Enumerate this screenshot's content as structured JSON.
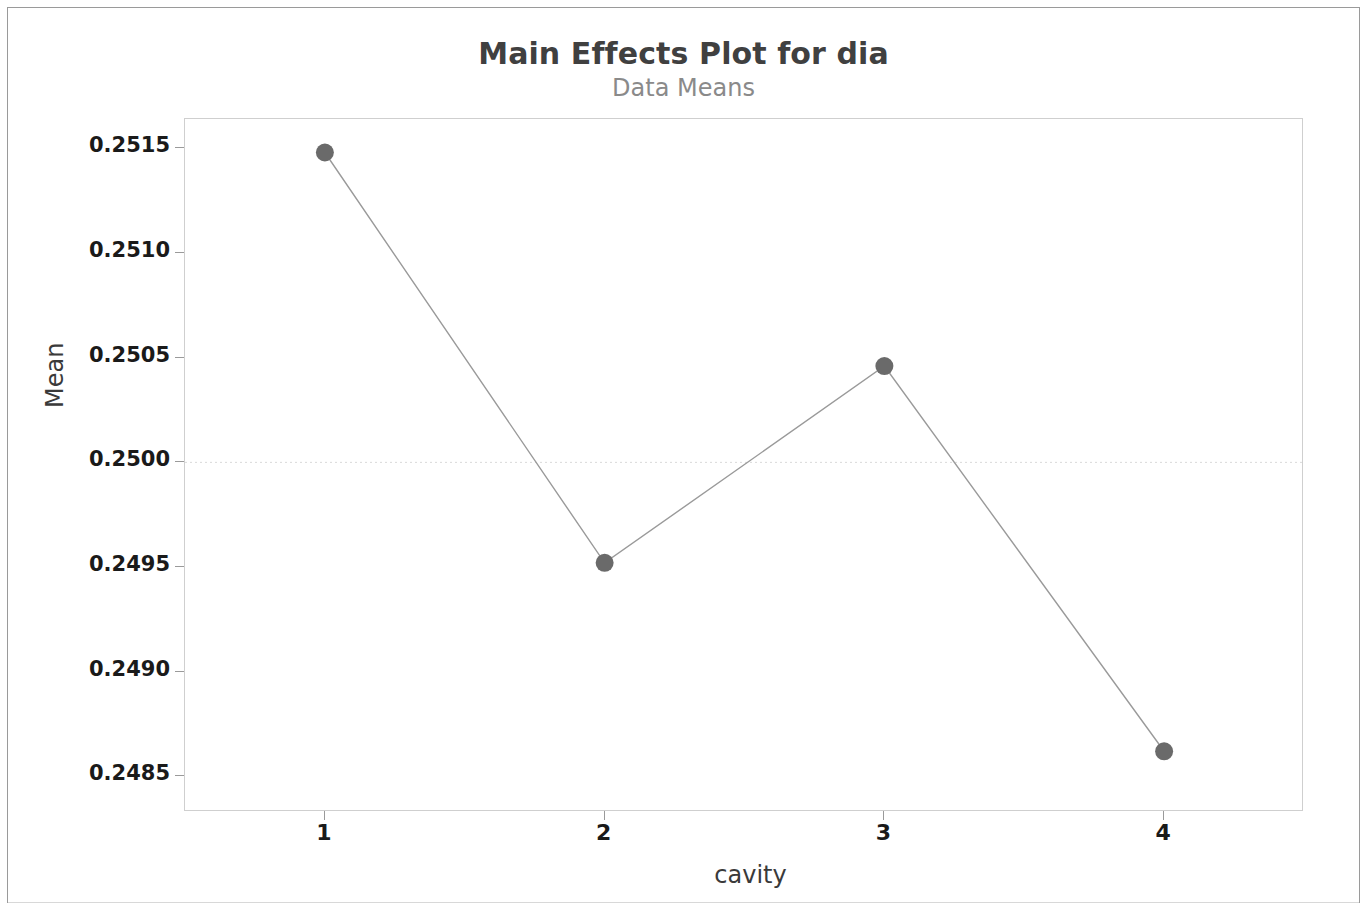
{
  "chart_data": {
    "type": "line",
    "title": "Main Effects Plot for dia",
    "subtitle": "Data Means",
    "xlabel": "cavity",
    "ylabel": "Mean",
    "categories": [
      "1",
      "2",
      "3",
      "4"
    ],
    "values": [
      0.25148,
      0.24952,
      0.25046,
      0.24862
    ],
    "ylim": [
      0.24833,
      0.25164
    ],
    "y_ticks": [
      "0.2485",
      "0.2490",
      "0.2495",
      "0.2500",
      "0.2505",
      "0.2510",
      "0.2515"
    ],
    "y_tick_values": [
      0.2485,
      0.249,
      0.2495,
      0.25,
      0.2505,
      0.251,
      0.2515
    ],
    "x_ticks": [
      "1",
      "2",
      "3",
      "4"
    ],
    "reference_line": 0.25,
    "grid": false,
    "legend": "none",
    "marker": "filled-circle",
    "marker_color": "#6a6a6a",
    "line_color": "#9a9a9a",
    "reference_line_color": "#d9d9d9",
    "plot_border_color": "#cfcfcf",
    "title_color": "#404040",
    "subtitle_color": "#8a8a8a"
  }
}
